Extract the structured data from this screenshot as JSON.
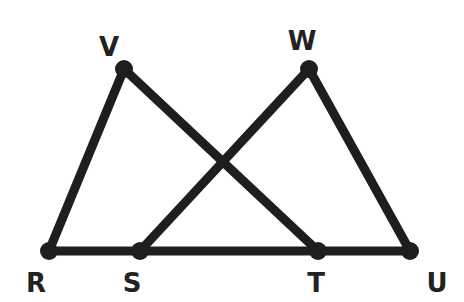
{
  "diagram": {
    "colors": {
      "line": "#1e1e1e",
      "label": "#222222",
      "background": "#ffffff"
    },
    "points": {
      "V": {
        "label": "V",
        "x": 124,
        "y": 69,
        "lx": 109,
        "ly": 56
      },
      "W": {
        "label": "W",
        "x": 309,
        "y": 69,
        "lx": 302,
        "ly": 50
      },
      "R": {
        "label": "R",
        "x": 49,
        "y": 251,
        "lx": 36,
        "ly": 292
      },
      "S": {
        "label": "S",
        "x": 140,
        "y": 251,
        "lx": 132,
        "ly": 292
      },
      "T": {
        "label": "T",
        "x": 318,
        "y": 251,
        "lx": 316,
        "ly": 292
      },
      "U": {
        "label": "U",
        "x": 410,
        "y": 251,
        "lx": 437,
        "ly": 292
      }
    },
    "segments": [
      {
        "from": "R",
        "to": "U"
      },
      {
        "from": "R",
        "to": "V"
      },
      {
        "from": "V",
        "to": "T"
      },
      {
        "from": "S",
        "to": "W"
      },
      {
        "from": "W",
        "to": "U"
      }
    ]
  }
}
